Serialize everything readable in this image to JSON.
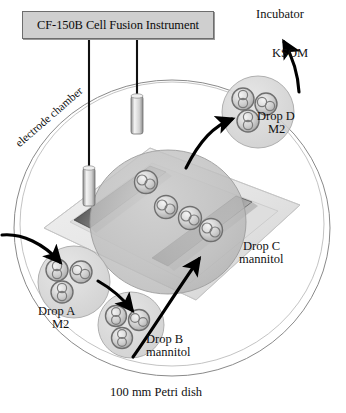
{
  "figure": {
    "title_box": "CF-150B Cell Fusion Instrument",
    "petri_dish_caption": "100 mm Petri dish",
    "electrode_chamber_caption": "electrode chamber",
    "destination": "Incubator",
    "transfer_medium": "KSOM"
  },
  "drops": [
    {
      "id": "A",
      "label": "Drop A",
      "medium": "M2",
      "cells": 3
    },
    {
      "id": "B",
      "label": "Drop B",
      "medium": "mannitol",
      "cells": 3
    },
    {
      "id": "C",
      "label": "Drop C",
      "medium": "mannitol",
      "cells": 4
    },
    {
      "id": "D",
      "label": "Drop D",
      "medium": "M2",
      "cells": 3
    }
  ],
  "colors": {
    "box_fill": "#cfcfcf",
    "box_border": "#6d6d6d",
    "dish_outline": "#7d7d7d",
    "slide_fill": "#e2e2e2",
    "electrode_dark": "#3a3a3a",
    "drop_fill": "#d8d8d8",
    "cell_stroke": "#6a6a6a",
    "arrow": "#000000",
    "text": "#111111"
  },
  "electrodes": {
    "count": 2,
    "rod_count": 2
  }
}
